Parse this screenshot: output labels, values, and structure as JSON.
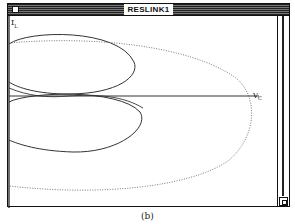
{
  "window": {
    "title": "RESLINK1"
  },
  "plot": {
    "y_axis_label": "I",
    "y_axis_subscript": "L",
    "x_axis_label": "V",
    "x_axis_subscript": "C",
    "curves": [
      {
        "name": "upper-loop",
        "style": "solid"
      },
      {
        "name": "lower-loop",
        "style": "solid"
      },
      {
        "name": "outer-loop",
        "style": "dotted"
      }
    ]
  },
  "figure_caption": "(b)",
  "colors": {
    "frame": "#111111",
    "background": "#ffffff",
    "curve": "#333333"
  }
}
